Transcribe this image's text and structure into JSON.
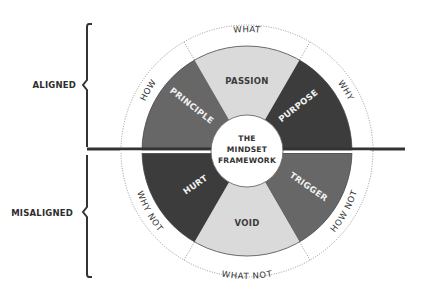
{
  "diagram": {
    "title_lines": [
      "THE",
      "MINDSET",
      "FRAMEWORK"
    ],
    "side_labels": {
      "top": "ALIGNED",
      "bottom": "MISALIGNED"
    },
    "segments": [
      {
        "id": "passion",
        "label": "PASSION",
        "ring_label": "WHAT",
        "shade": "light",
        "color": "#dadada",
        "half": "aligned"
      },
      {
        "id": "purpose",
        "label": "PURPOSE",
        "ring_label": "WHY",
        "shade": "dark",
        "color": "#3c3c3c",
        "half": "aligned"
      },
      {
        "id": "principle",
        "label": "PRINCIPLE",
        "ring_label": "HOW",
        "shade": "medium",
        "color": "#676767",
        "half": "aligned"
      },
      {
        "id": "void",
        "label": "VOID",
        "ring_label": "WHAT NOT",
        "shade": "light",
        "color": "#dadada",
        "half": "misaligned"
      },
      {
        "id": "hurt",
        "label": "HURT",
        "ring_label": "WHY NOT",
        "shade": "dark",
        "color": "#3c3c3c",
        "half": "misaligned"
      },
      {
        "id": "trigger",
        "label": "TRIGGER",
        "ring_label": "HOW NOT",
        "shade": "medium",
        "color": "#676767",
        "half": "misaligned"
      }
    ],
    "colors": {
      "light": "#dadada",
      "medium": "#676767",
      "dark": "#3c3c3c",
      "line": "#333333",
      "background": "#ffffff"
    }
  }
}
